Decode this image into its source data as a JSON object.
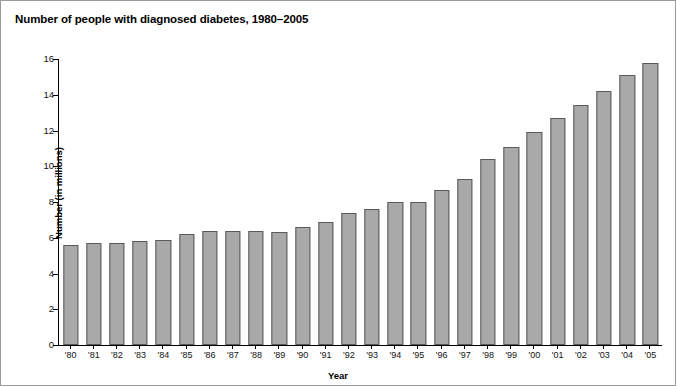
{
  "chart_data": {
    "type": "bar",
    "title": "Number of people with diagnosed diabetes, 1980–2005",
    "xlabel": "Year",
    "ylabel": "Number (in millions)",
    "categories": [
      "'80",
      "'81",
      "'82",
      "'83",
      "'84",
      "'85",
      "'86",
      "'87",
      "'88",
      "'89",
      "'90",
      "'91",
      "'92",
      "'93",
      "'94",
      "'95",
      "'96",
      "'97",
      "'98",
      "'99",
      "'00",
      "'01",
      "'02",
      "'03",
      "'04",
      "'05"
    ],
    "values": [
      5.6,
      5.7,
      5.7,
      5.8,
      5.9,
      6.2,
      6.4,
      6.4,
      6.4,
      6.3,
      6.6,
      6.9,
      7.4,
      7.6,
      8.0,
      8.0,
      8.7,
      9.3,
      10.4,
      11.1,
      11.9,
      12.7,
      13.4,
      14.2,
      15.1,
      15.8
    ],
    "ylim": [
      0,
      16
    ],
    "yticks": [
      0,
      2,
      4,
      6,
      8,
      10,
      12,
      14,
      16
    ],
    "ytick_labels": [
      "0",
      "2",
      "4",
      "6",
      "8",
      "10",
      "12",
      "14",
      "16"
    ],
    "grid": false,
    "legend": "none",
    "bar_color": "#a9a9a9",
    "bar_edge_color": "#5a5a5a",
    "axis_color": "#000000",
    "background_color": "#ffffff"
  }
}
